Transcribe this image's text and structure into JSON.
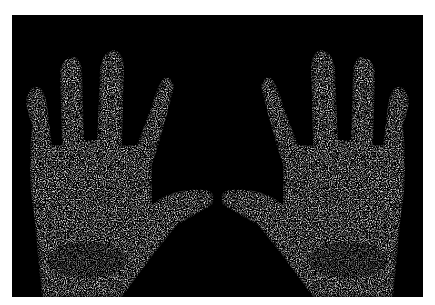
{
  "image": {
    "subject": "Scintigraphic scan of two hands, palms down, fingers up",
    "background_color": "#ffffff",
    "frame_color": "#000000",
    "speckle_color": "#d8d8d8",
    "hands": [
      {
        "side": "left",
        "fingers": 4,
        "thumb_direction": "right"
      },
      {
        "side": "right",
        "fingers": 4,
        "thumb_direction": "left"
      }
    ]
  }
}
